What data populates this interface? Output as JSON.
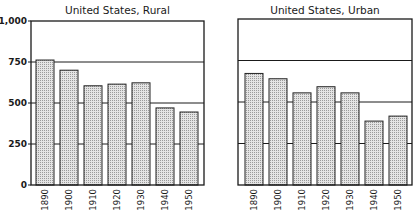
{
  "chart_data": [
    {
      "type": "bar",
      "title": "United States, Rural",
      "categories": [
        "1890",
        "1900",
        "1910",
        "1920",
        "1930",
        "1940",
        "1950"
      ],
      "values": [
        762,
        700,
        605,
        615,
        623,
        470,
        445
      ],
      "xlabel": "",
      "ylabel": "",
      "ylim": [
        0,
        1000
      ],
      "yticks": [
        0,
        250,
        500,
        750,
        1000
      ],
      "ytick_labels": [
        "0",
        "250",
        "500",
        "750",
        "1,000"
      ],
      "grid": true
    },
    {
      "type": "bar",
      "title": "United States, Urban",
      "categories": [
        "1890",
        "1900",
        "1910",
        "1920",
        "1930",
        "1940",
        "1950"
      ],
      "values": [
        672,
        640,
        555,
        592,
        555,
        385,
        415
      ],
      "xlabel": "",
      "ylabel": "",
      "ylim": [
        0,
        1000
      ],
      "yticks": [
        0,
        250,
        500,
        750,
        1000
      ],
      "grid": true
    }
  ],
  "colors": {
    "bar_fill": "#d6d6d6",
    "bar_stroke": "#222222",
    "axis": "#1a1a1a"
  }
}
